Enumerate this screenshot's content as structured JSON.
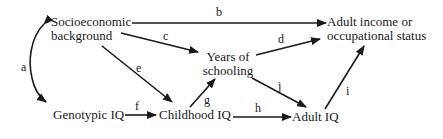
{
  "diagram": {
    "type": "path-diagram",
    "nodes": {
      "ses": {
        "line1": "Socioeconomic",
        "line2": "background"
      },
      "income": {
        "line1": "Adult income or",
        "line2": "occupational status"
      },
      "schooling": {
        "line1": "Years of",
        "line2": "schooling"
      },
      "geno_iq": {
        "label": "Genotypic IQ"
      },
      "child_iq": {
        "label": "Childhood IQ"
      },
      "adult_iq": {
        "label": "Adult IQ"
      }
    },
    "edges": [
      {
        "id": "a",
        "from": "ses",
        "to": "geno_iq",
        "label": "a",
        "bidirectional": true
      },
      {
        "id": "b",
        "from": "ses",
        "to": "income",
        "label": "b"
      },
      {
        "id": "c",
        "from": "ses",
        "to": "schooling",
        "label": "c"
      },
      {
        "id": "d",
        "from": "schooling",
        "to": "income",
        "label": "d"
      },
      {
        "id": "e",
        "from": "ses",
        "to": "child_iq",
        "label": "e"
      },
      {
        "id": "f",
        "from": "geno_iq",
        "to": "child_iq",
        "label": "f"
      },
      {
        "id": "g",
        "from": "child_iq",
        "to": "schooling",
        "label": "g"
      },
      {
        "id": "h",
        "from": "child_iq",
        "to": "adult_iq",
        "label": "h"
      },
      {
        "id": "i",
        "from": "adult_iq",
        "to": "income",
        "label": "i"
      },
      {
        "id": "j",
        "from": "schooling",
        "to": "adult_iq",
        "label": "j"
      }
    ],
    "colors": {
      "ink": "#1a1a1a",
      "background": "#ffffff"
    }
  }
}
